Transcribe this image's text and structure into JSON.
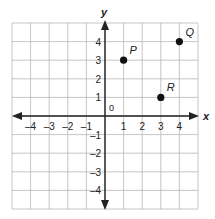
{
  "chart_data": {
    "type": "scatter",
    "title": "",
    "xlabel": "x",
    "ylabel": "y",
    "xlim": [
      -5,
      5
    ],
    "ylim": [
      -5,
      5
    ],
    "grid": true,
    "origin_label": "0",
    "x_ticks": [
      -4,
      -3,
      -2,
      -1,
      1,
      2,
      3,
      4
    ],
    "x_tick_labels": [
      "–4",
      "–3",
      "–2",
      "–1",
      "1",
      "2",
      "3",
      "4"
    ],
    "y_ticks": [
      4,
      3,
      2,
      1,
      -1,
      -2,
      -3,
      -4
    ],
    "y_tick_labels": [
      "4",
      "3",
      "2",
      "1",
      "–1",
      "–2",
      "–3",
      "–4"
    ],
    "points": [
      {
        "label": "P",
        "x": 1,
        "y": 3
      },
      {
        "label": "Q",
        "x": 4,
        "y": 4
      },
      {
        "label": "R",
        "x": 3,
        "y": 1
      }
    ]
  },
  "colors": {
    "grid": "#b8b8b8",
    "axis": "#222222",
    "point": "#111111",
    "text": "#222222"
  }
}
